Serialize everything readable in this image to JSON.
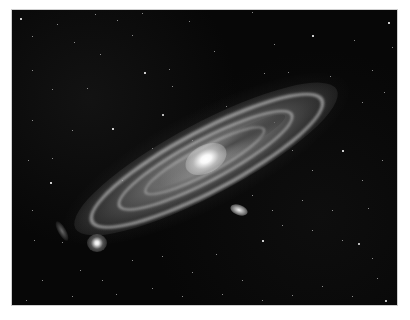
{
  "image": {
    "subject": "spiral galaxy with two satellite galaxies on a star field",
    "colors": {
      "background_page": "#ffffff",
      "sky": "#070707",
      "core": "#ffffff",
      "arms": "#d7d7d7"
    }
  },
  "stars": [
    [
      8,
      8,
      1.6
    ],
    [
      45,
      14,
      1.4
    ],
    [
      83,
      4,
      1.2
    ],
    [
      130,
      3,
      1.4
    ],
    [
      177,
      11,
      1.2
    ],
    [
      240,
      2,
      1.2
    ],
    [
      300,
      25,
      1.6
    ],
    [
      342,
      30,
      1.4
    ],
    [
      376,
      12,
      1.6
    ],
    [
      380,
      37,
      1.4
    ],
    [
      20,
      26,
      1.2
    ],
    [
      62,
      32,
      1.2
    ],
    [
      88,
      44,
      1.2
    ],
    [
      120,
      25,
      1.4
    ],
    [
      132,
      62,
      1.6
    ],
    [
      157,
      59,
      1.2
    ],
    [
      202,
      41,
      1.2
    ],
    [
      262,
      34,
      1.4
    ],
    [
      318,
      66,
      1.4
    ],
    [
      360,
      60,
      1.2
    ],
    [
      40,
      79,
      1.2
    ],
    [
      75,
      78,
      1.2
    ],
    [
      150,
      104,
      2.0
    ],
    [
      160,
      76,
      1.4
    ],
    [
      214,
      96,
      1.2
    ],
    [
      252,
      63,
      1.2
    ],
    [
      276,
      62,
      1.4
    ],
    [
      350,
      92,
      1.4
    ],
    [
      372,
      82,
      1.2
    ],
    [
      20,
      110,
      1.2
    ],
    [
      60,
      120,
      1.2
    ],
    [
      100,
      118,
      1.6
    ],
    [
      140,
      138,
      1.2
    ],
    [
      16,
      150,
      1.2
    ],
    [
      40,
      148,
      1.2
    ],
    [
      330,
      140,
      1.6
    ],
    [
      350,
      170,
      1.2
    ],
    [
      370,
      150,
      1.4
    ],
    [
      300,
      160,
      1.2
    ],
    [
      290,
      190,
      1.2
    ],
    [
      38,
      172,
      1.6
    ],
    [
      20,
      200,
      1.2
    ],
    [
      22,
      230,
      1.2
    ],
    [
      50,
      232,
      1.2
    ],
    [
      68,
      260,
      1.2
    ],
    [
      90,
      270,
      1.4
    ],
    [
      120,
      250,
      1.2
    ],
    [
      150,
      246,
      1.2
    ],
    [
      180,
      262,
      1.2
    ],
    [
      204,
      244,
      1.4
    ],
    [
      230,
      270,
      1.2
    ],
    [
      250,
      230,
      1.6
    ],
    [
      270,
      215,
      1.2
    ],
    [
      300,
      220,
      1.2
    ],
    [
      330,
      230,
      1.4
    ],
    [
      346,
      233,
      2.0
    ],
    [
      360,
      248,
      1.2
    ],
    [
      365,
      268,
      1.2
    ],
    [
      373,
      290,
      1.8
    ],
    [
      340,
      286,
      1.2
    ],
    [
      310,
      276,
      1.2
    ],
    [
      280,
      285,
      1.2
    ],
    [
      250,
      290,
      1.2
    ],
    [
      210,
      284,
      1.2
    ],
    [
      170,
      286,
      1.2
    ],
    [
      140,
      278,
      1.2
    ],
    [
      104,
      284,
      1.2
    ],
    [
      60,
      286,
      1.2
    ],
    [
      30,
      270,
      1.2
    ],
    [
      14,
      290,
      1.2
    ],
    [
      180,
      130,
      1.2
    ],
    [
      262,
      112,
      1.4
    ],
    [
      280,
      140,
      1.2
    ],
    [
      110,
      170,
      1.2
    ],
    [
      260,
      200,
      1.2
    ],
    [
      240,
      185,
      1.2
    ],
    [
      320,
      200,
      1.2
    ],
    [
      356,
      198,
      1.4
    ],
    [
      20,
      60,
      1.2
    ],
    [
      105,
      10,
      1.2
    ]
  ]
}
